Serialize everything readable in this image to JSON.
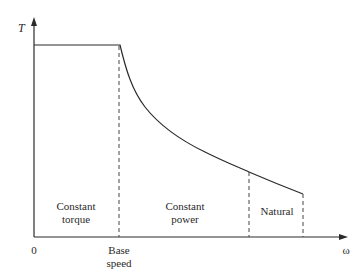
{
  "diagram": {
    "y_axis_label": "T",
    "x_axis_label": "ω",
    "origin_label": "0",
    "base_speed_label_line1": "Base",
    "base_speed_label_line2": "speed",
    "regions": [
      {
        "line1": "Constant",
        "line2": "torque"
      },
      {
        "line1": "Constant",
        "line2": "power"
      },
      {
        "line1": "Natural",
        "line2": ""
      }
    ],
    "color": "#2a2a2a"
  }
}
